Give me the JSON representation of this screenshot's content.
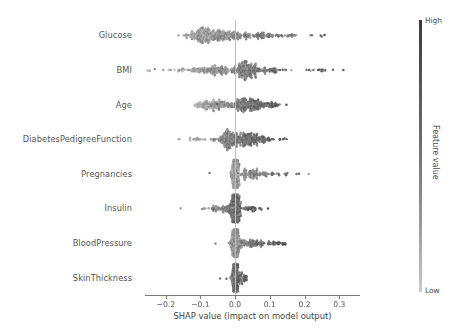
{
  "chart_data": {
    "type": "scatter",
    "plot_kind": "shap-beeswarm-summary",
    "title": "",
    "xlabel": "SHAP value (impact on model output)",
    "ylabel": "",
    "xlim": [
      -0.26,
      0.36
    ],
    "xticks": [
      -0.2,
      -0.1,
      0.0,
      0.1,
      0.2,
      0.3
    ],
    "xticklabels": [
      "−0.2",
      "−0.1",
      "0.0",
      "0.1",
      "0.2",
      "0.3"
    ],
    "grid": false,
    "zero_reference_line": 0.0,
    "categories": [
      "Glucose",
      "BMI",
      "Age",
      "DiabetesPedigreeFunction",
      "Pregnancies",
      "Insulin",
      "BloodPressure",
      "SkinThickness"
    ],
    "colorbar": {
      "label": "Feature value",
      "high_label": "High",
      "low_label": "Low",
      "high_color": "#3b3b3b",
      "low_color": "#c9c9c9",
      "position": "right"
    },
    "series": [
      {
        "name": "Glucose",
        "row": 0,
        "n_points": 360,
        "shap_range": [
          -0.235,
          0.345
        ],
        "dense_core": [
          -0.135,
          0.055
        ],
        "peak_density_at": -0.085,
        "spread_profile": "wide-bimodal",
        "mean_abs_shap": 0.082
      },
      {
        "name": "BMI",
        "row": 1,
        "n_points": 340,
        "shap_range": [
          -0.255,
          0.315
        ],
        "dense_core": [
          -0.02,
          0.06
        ],
        "peak_density_at": 0.025,
        "spread_profile": "right-heavy",
        "mean_abs_shap": 0.055
      },
      {
        "name": "Age",
        "row": 2,
        "n_points": 330,
        "shap_range": [
          -0.145,
          0.165
        ],
        "dense_core": [
          -0.075,
          0.06
        ],
        "peak_density_at": 0.025,
        "spread_profile": "bimodal",
        "mean_abs_shap": 0.048
      },
      {
        "name": "DiabetesPedigreeFunction",
        "row": 3,
        "n_points": 320,
        "shap_range": [
          -0.165,
          0.155
        ],
        "dense_core": [
          -0.04,
          0.045
        ],
        "peak_density_at": -0.015,
        "spread_profile": "left-peak",
        "mean_abs_shap": 0.032
      },
      {
        "name": "Pregnancies",
        "row": 4,
        "n_points": 300,
        "shap_range": [
          -0.095,
          0.265
        ],
        "dense_core": [
          -0.012,
          0.012
        ],
        "peak_density_at": 0.0,
        "spread_profile": "narrow-core-right-tail",
        "mean_abs_shap": 0.021
      },
      {
        "name": "Insulin",
        "row": 5,
        "n_points": 300,
        "shap_range": [
          -0.185,
          0.105
        ],
        "dense_core": [
          -0.015,
          0.015
        ],
        "peak_density_at": 0.0,
        "spread_profile": "narrow-core",
        "mean_abs_shap": 0.019
      },
      {
        "name": "BloodPressure",
        "row": 6,
        "n_points": 300,
        "shap_range": [
          -0.075,
          0.145
        ],
        "dense_core": [
          -0.012,
          0.018
        ],
        "peak_density_at": 0.002,
        "spread_profile": "narrow-core-right-tail",
        "mean_abs_shap": 0.016
      },
      {
        "name": "SkinThickness",
        "row": 7,
        "n_points": 280,
        "shap_range": [
          -0.07,
          0.045
        ],
        "dense_core": [
          -0.008,
          0.01
        ],
        "peak_density_at": 0.0,
        "spread_profile": "very-narrow",
        "mean_abs_shap": 0.008
      }
    ]
  }
}
